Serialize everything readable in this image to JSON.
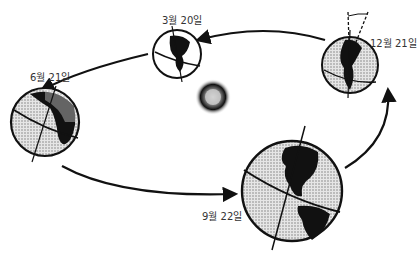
{
  "labels": {
    "march": "3월 20일",
    "june": "6월 21일",
    "september": "9월 22일",
    "december": "12월 21일"
  },
  "colors": {
    "ink": "#111111",
    "shade": "#bdbdbd",
    "background": "#ffffff"
  }
}
